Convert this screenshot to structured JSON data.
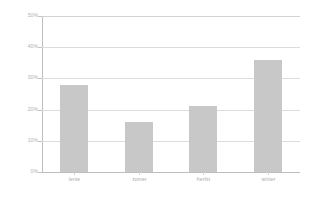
{
  "chart_data": {
    "type": "bar",
    "title": "",
    "subtitle": "",
    "xlabel": "",
    "ylabel": "",
    "categories": [
      "lente",
      "zomer",
      "herfst",
      "winter"
    ],
    "values": [
      28,
      16,
      21,
      36
    ],
    "ylim": [
      0,
      50
    ],
    "ytick_values": [
      0,
      10,
      20,
      30,
      40,
      50
    ],
    "ytick_labels": [
      "0%",
      "10%",
      "20%",
      "30%",
      "40%",
      "50%"
    ],
    "grid": true,
    "legend": false,
    "bar_color": "#c8c8c8",
    "gridline_color": "#dcdcdc",
    "axis_color": "#bdbdbd",
    "tick_label_color": "#b0b0b0",
    "background": "#ffffff"
  }
}
